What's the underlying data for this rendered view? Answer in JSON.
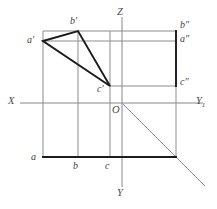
{
  "figure": {
    "type": "descriptive-geometry-orthographic-projection",
    "background_color": "#ffffff",
    "line_color_thin": "#8d8d8d",
    "line_color_bold": "#1c1c1c",
    "text_color": "#3d3d3d"
  },
  "axes": {
    "origin": {
      "label": "O",
      "x": 122,
      "y": 103
    },
    "x_axis": {
      "label": "X",
      "label_x": 9,
      "label_y": 97,
      "x1": 20,
      "y1": 103,
      "x2": 203,
      "y2": 103
    },
    "z_axis": {
      "label": "Z",
      "label_x": 118,
      "label_y": 9,
      "x1": 122,
      "y1": 17,
      "x2": 122,
      "y2": 103
    },
    "y_axis": {
      "label": "Y",
      "label_x": 118,
      "label_y": 189,
      "x1": 122,
      "y1": 103,
      "x2": 122,
      "y2": 187
    },
    "y1_axis": {
      "label": "Y",
      "subscript": "1",
      "label_x": 198,
      "label_y": 97
    }
  },
  "points": {
    "a_front": {
      "label": "a′",
      "x": 43,
      "y": 41,
      "label_x": 27,
      "label_y": 35
    },
    "b_front": {
      "label": "b′",
      "x": 78,
      "y": 31,
      "label_x": 70,
      "label_y": 16
    },
    "c_front": {
      "label": "c′",
      "x": 110,
      "y": 86,
      "label_x": 97,
      "label_y": 84
    },
    "a_top": {
      "label": "a",
      "x": 43,
      "y": 157,
      "label_x": 31,
      "label_y": 154
    },
    "b_top": {
      "label": "b",
      "x": 78,
      "y": 157,
      "label_x": 73,
      "label_y": 161
    },
    "c_top": {
      "label": "c",
      "x": 110,
      "y": 157,
      "label_x": 105,
      "label_y": 161
    },
    "a_side": {
      "label": "a″",
      "x": 176,
      "y": 41,
      "label_x": 180,
      "label_y": 36
    },
    "b_side": {
      "label": "b″",
      "x": 176,
      "y": 31,
      "label_x": 180,
      "label_y": 20
    },
    "c_side": {
      "label": "c″",
      "x": 176,
      "y": 86,
      "label_x": 180,
      "label_y": 79
    }
  },
  "geometry": {
    "frontal_triangle": {
      "name": "triangle-a-b-c-front",
      "vertices": [
        [
          43,
          41
        ],
        [
          78,
          31
        ],
        [
          110,
          86
        ]
      ]
    },
    "horizontal_base_line": {
      "x1": 43,
      "y1": 157,
      "x2": 176,
      "y2": 157
    },
    "profile_right_edge": {
      "x1": 176,
      "y1": 31,
      "x2": 176,
      "y2": 86
    },
    "profile_rect": {
      "x": 122,
      "y": 31,
      "width": 54,
      "height": 55
    },
    "front_rect": {
      "x": 43,
      "y": 31,
      "width": 133,
      "height": 126
    },
    "diagonal": {
      "x1": 122,
      "y1": 103,
      "x2": 205,
      "y2": 186
    },
    "verticals": [
      {
        "name": "vertical-a",
        "x": 43,
        "y1": 31,
        "y2": 157
      },
      {
        "name": "vertical-b",
        "x": 78,
        "y1": 31,
        "y2": 157
      },
      {
        "name": "vertical-c",
        "x": 110,
        "y1": 31,
        "y2": 157
      },
      {
        "name": "vertical-right",
        "x": 176,
        "y1": 31,
        "y2": 157
      }
    ],
    "horizontals": [
      {
        "name": "horizontal-b-level",
        "y": 31,
        "x1": 43,
        "x2": 176
      },
      {
        "name": "horizontal-a-level",
        "y": 41,
        "x1": 43,
        "x2": 176
      },
      {
        "name": "horizontal-c-level",
        "y": 86,
        "x1": 110,
        "x2": 176
      }
    ]
  }
}
